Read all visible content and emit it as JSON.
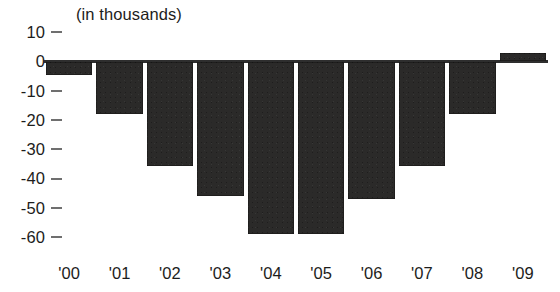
{
  "chart_data": {
    "type": "bar",
    "title": "(in thousands)",
    "xlabel": "",
    "ylabel": "",
    "categories": [
      "'00",
      "'01",
      "'02",
      "'03",
      "'04",
      "'05",
      "'06",
      "'07",
      "'08",
      "'09"
    ],
    "values": [
      -4.5,
      -18,
      -35.5,
      -46,
      -59,
      -59,
      -47,
      -35.5,
      -18,
      3
    ],
    "ylim": [
      -60,
      10
    ],
    "yticks": [
      10,
      0,
      -10,
      -20,
      -30,
      -40,
      -50,
      -60
    ],
    "ytick_labels": [
      "10",
      "0",
      "-10",
      "-20",
      "-30",
      "-40",
      "-50",
      "-60"
    ],
    "grid": false,
    "legend": null,
    "bar_color": "#2b2a29",
    "axis_color": "#2e2e2e",
    "tick_color": "#6f6f6f",
    "text_color": "#1d1d1b",
    "background": "#ffffff"
  }
}
